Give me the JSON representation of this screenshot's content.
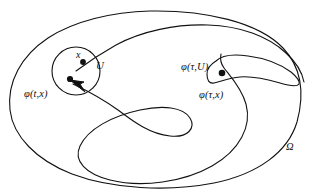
{
  "figure": {
    "type": "mathematical-diagram",
    "background_color": "#ffffff",
    "stroke_color": "#111111",
    "stroke_width": 1.1
  },
  "labels": {
    "point_x": "x",
    "set_U": "U",
    "flow_t_x": "φ(t,x)",
    "flow_tau_U": "φ(τ,U)",
    "flow_tau_x": "φ(τ,x)",
    "domain_omega": "Ω"
  },
  "elements": {
    "outer_boundary": "closed oval curve bounding the domain Omega",
    "neighborhood_circle": "small circle labeled U in the upper left",
    "deformed_neighborhood": "stretched crescent-shaped image of U labeled phi(tau,U) on the right",
    "trajectory": "serpentine flow curve from U winding through the domain to phi(tau,x)",
    "arrowhead": "arrow on the trajectory pointing back toward the point phi(t,x) inside U",
    "dots": [
      {
        "name": "x",
        "position": "upper right inside circle U"
      },
      {
        "name": "phi(t,x)",
        "position": "lower left inside circle U"
      },
      {
        "name": "phi(tau,x)",
        "position": "inside the deformed crescent on the right"
      }
    ]
  }
}
